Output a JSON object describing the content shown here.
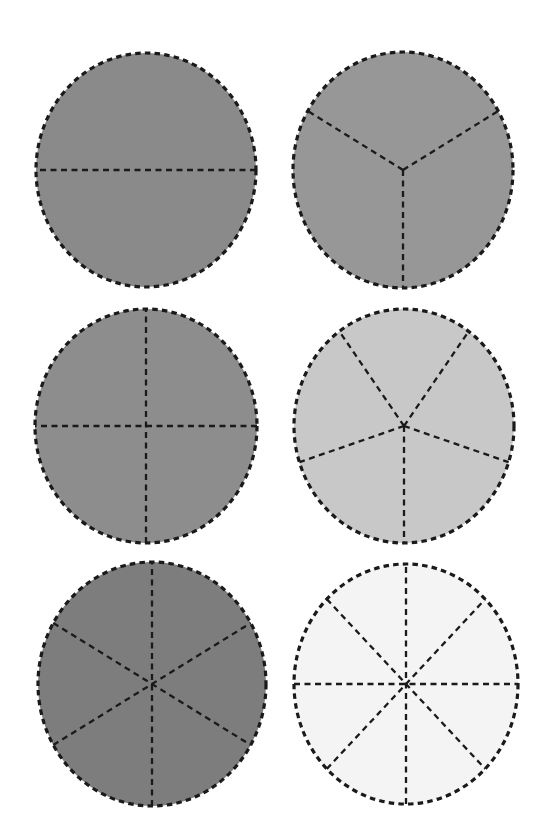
{
  "page": {
    "background_color": "#ffffff",
    "width": 546,
    "height": 839
  },
  "chart_data": {
    "type": "pie",
    "subtitle": "",
    "xlabel": "",
    "ylabel": "",
    "grid": false,
    "legend": "none",
    "layout": {
      "rows": 3,
      "columns": 2,
      "order": "row-major"
    },
    "outline_style": "dashed",
    "outline_color": "#1a1a1a",
    "divider_style": "dashed",
    "divider_color": "#1a1a1a",
    "charts": [
      {
        "id": "circle-halves",
        "label": "halves",
        "slices": 2,
        "fraction_each": "1/2",
        "values": [
          50,
          50
        ],
        "slice_angle_degrees": 180,
        "start_angle_degrees": 0,
        "fill_color": "#8a8a8a",
        "center_x": 146,
        "center_y": 170,
        "radius_x": 110,
        "radius_y": 117,
        "divider_count": 1
      },
      {
        "id": "circle-thirds",
        "label": "thirds",
        "slices": 3,
        "fraction_each": "1/3",
        "values": [
          33.3,
          33.3,
          33.3
        ],
        "slice_angle_degrees": 120,
        "start_angle_degrees": 90,
        "fill_color": "#979797",
        "center_x": 403,
        "center_y": 170,
        "radius_x": 110,
        "radius_y": 118,
        "divider_count": 3
      },
      {
        "id": "circle-fourths",
        "label": "fourths",
        "slices": 4,
        "fraction_each": "1/4",
        "values": [
          25,
          25,
          25,
          25
        ],
        "slice_angle_degrees": 90,
        "start_angle_degrees": 0,
        "fill_color": "#8d8d8d",
        "center_x": 146,
        "center_y": 426,
        "radius_x": 111,
        "radius_y": 117,
        "divider_count": 2
      },
      {
        "id": "circle-fifths",
        "label": "fifths",
        "slices": 5,
        "fraction_each": "1/5",
        "values": [
          20,
          20,
          20,
          20,
          20
        ],
        "slice_angle_degrees": 72,
        "start_angle_degrees": 90,
        "fill_color": "#c8c8c8",
        "center_x": 404,
        "center_y": 426,
        "radius_x": 110,
        "radius_y": 117,
        "divider_count": 5
      },
      {
        "id": "circle-sixths",
        "label": "sixths",
        "slices": 6,
        "fraction_each": "1/6",
        "values": [
          16.7,
          16.7,
          16.7,
          16.7,
          16.7,
          16.7
        ],
        "slice_angle_degrees": 60,
        "start_angle_degrees": 90,
        "fill_color": "#7d7d7d",
        "center_x": 152,
        "center_y": 684,
        "radius_x": 114,
        "radius_y": 122,
        "divider_count": 3
      },
      {
        "id": "circle-eighths",
        "label": "eighths",
        "slices": 8,
        "fraction_each": "1/8",
        "values": [
          12.5,
          12.5,
          12.5,
          12.5,
          12.5,
          12.5,
          12.5,
          12.5
        ],
        "slice_angle_degrees": 45,
        "start_angle_degrees": 90,
        "fill_color": "#f4f4f4",
        "center_x": 406,
        "center_y": 684,
        "radius_x": 112,
        "radius_y": 120,
        "divider_count": 4
      }
    ]
  }
}
